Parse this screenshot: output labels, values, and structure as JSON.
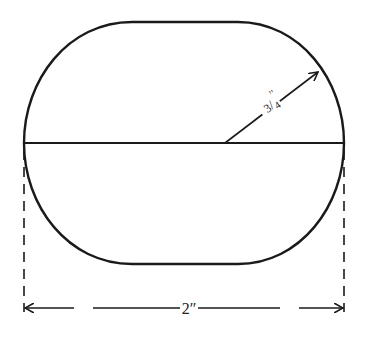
{
  "diagram": {
    "shape": "oval with flat top and bottom (rounded obround)",
    "radius_label": "3/4″",
    "radius_label_num": "3",
    "radius_label_den": "4",
    "radius_label_marks": "′′",
    "width_label": "2″",
    "colors": {
      "stroke": "#1a1a1a",
      "background": "#ffffff"
    }
  }
}
